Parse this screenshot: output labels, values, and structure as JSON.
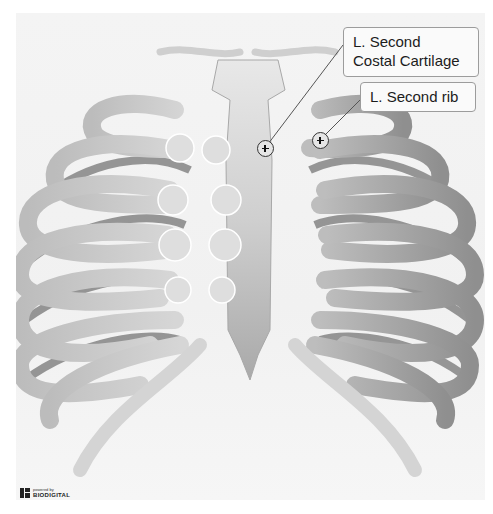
{
  "viewer": {
    "subject": "Rib cage (anterior view)",
    "background": "#f3f3f3",
    "bone_color": "#d2d2d2",
    "rib_shadow_color": "#8a8a8a"
  },
  "annotations": [
    {
      "id": "costal-cartilage",
      "label_line1": "L. Second",
      "label_line2": "Costal Cartilage",
      "marker": "plus-icon"
    },
    {
      "id": "second-rib",
      "label": "L. Second rib",
      "marker": "plus-icon"
    }
  ],
  "branding": {
    "small": "powered by",
    "name": "BIODIGITAL"
  }
}
